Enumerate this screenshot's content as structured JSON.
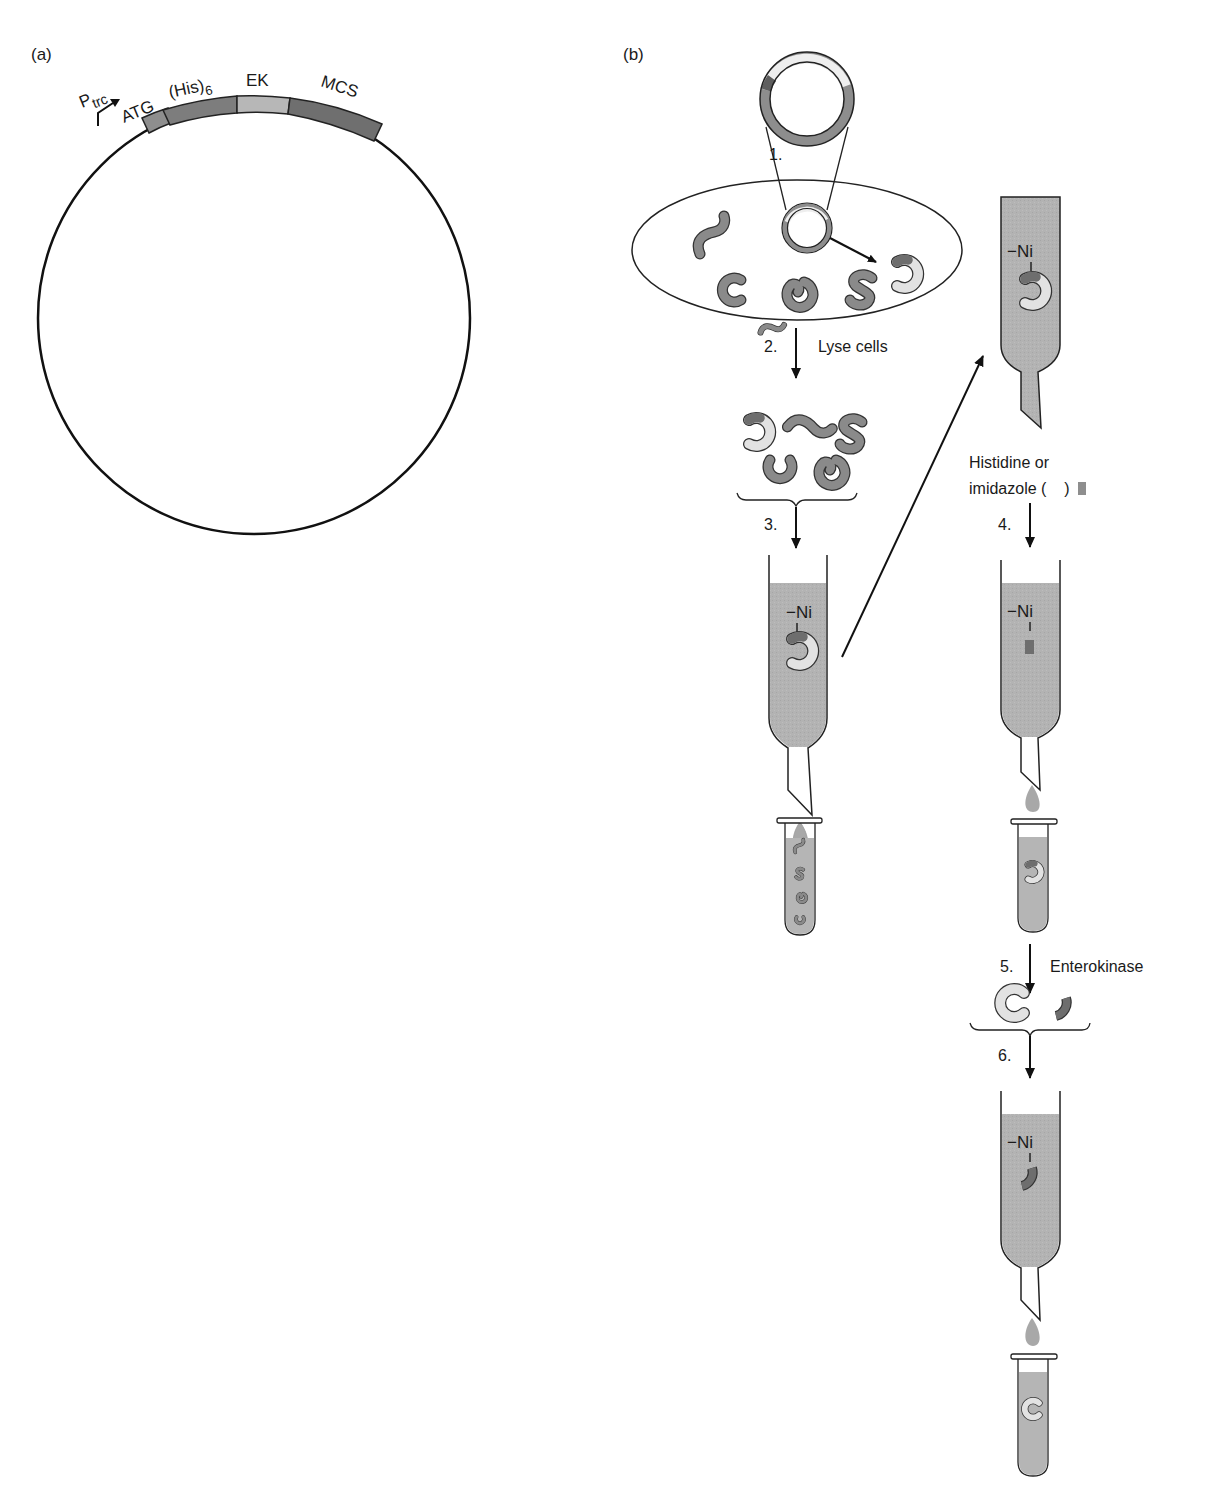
{
  "panels": {
    "a": {
      "label": "(a)"
    },
    "b": {
      "label": "(b)"
    }
  },
  "vector": {
    "promoter": {
      "main": "P",
      "sub": "trc"
    },
    "regions": [
      {
        "name": "ATG",
        "color": "#8e8e8e"
      },
      {
        "name": "(His)",
        "sub": "6",
        "color": "#7d7d7d"
      },
      {
        "name": "EK",
        "color": "#b7b7b7"
      },
      {
        "name": "MCS",
        "color": "#6f6f6f"
      }
    ]
  },
  "steps": [
    {
      "number": "1.",
      "label": ""
    },
    {
      "number": "2.",
      "label": "Lyse cells"
    },
    {
      "number": "3.",
      "label": ""
    },
    {
      "number": "4.",
      "label": "",
      "above_lines": [
        "Histidine or",
        "imidazole (",
        ")"
      ]
    },
    {
      "number": "5.",
      "label": "Enterokinase"
    },
    {
      "number": "6.",
      "label": ""
    }
  ],
  "columns": {
    "resin_label": "Ni"
  },
  "colors": {
    "protein": "#8a8a8a",
    "target_protein": "#e2e2e2",
    "his_tag": "#6e6e6e",
    "resin": "#b3b3b3",
    "eluate": "#b8b8b8",
    "outline": "#2a2a2a"
  }
}
